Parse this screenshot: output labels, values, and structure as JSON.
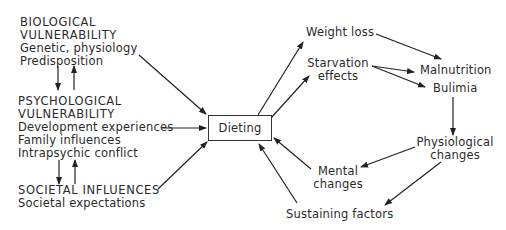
{
  "left": {
    "biological": {
      "title_line1": "BIOLOGICAL",
      "title_line2": "VULNERABILITY",
      "items": [
        "Genetic, physiology",
        "Predisposition"
      ]
    },
    "psychological": {
      "title_line1": "PSYCHOLOGICAL",
      "title_line2": "VULNERABILITY",
      "items": [
        "Development experiences",
        "Family influences",
        "Intrapsychic conflict"
      ]
    },
    "societal": {
      "title": "SOCIETAL INFLUENCES",
      "items": [
        "Societal expectations"
      ]
    }
  },
  "center": {
    "label": "Dieting"
  },
  "right": {
    "weight_loss": "Weight loss",
    "starvation": {
      "line1": "Starvation",
      "line2": "effects"
    },
    "malnutrition": "Malnutrition",
    "bulimia": "Bulimia",
    "physiological": {
      "line1": "Physiological",
      "line2": "changes"
    },
    "mental": {
      "line1": "Mental",
      "line2": "changes"
    },
    "sustaining": "Sustaining factors"
  },
  "colors": {
    "ink": "#2a2a2a",
    "background": "#ffffff"
  }
}
